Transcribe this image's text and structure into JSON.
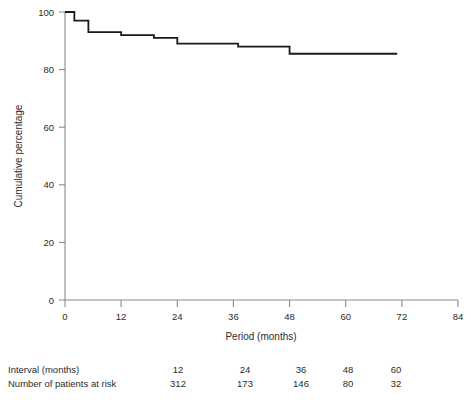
{
  "chart_data": {
    "type": "line",
    "subtype": "kaplan-meier-step",
    "title": "",
    "xlabel": "Period (months)",
    "ylabel": "Cumulative percentage",
    "xlim": [
      0,
      84
    ],
    "ylim": [
      0,
      100
    ],
    "xticks": [
      0,
      12,
      24,
      36,
      48,
      60,
      72,
      84
    ],
    "xticklabels": [
      "0",
      "12",
      "24",
      "36",
      "48",
      "60",
      "72",
      "84"
    ],
    "yticks": [
      0,
      20,
      40,
      60,
      80,
      100
    ],
    "yticklabels": [
      "0",
      "20",
      "40",
      "60",
      "80",
      "100"
    ],
    "grid": false,
    "legend": null,
    "series": [
      {
        "name": "Cumulative percentage",
        "color": "#1a1a1a",
        "step": "post",
        "x": [
          0,
          1,
          2,
          4,
          5,
          11,
          12,
          18,
          19,
          23,
          24,
          36,
          37,
          47,
          48,
          71
        ],
        "y": [
          100,
          100,
          97,
          97,
          93,
          93,
          92,
          92,
          91,
          91,
          89,
          89,
          88,
          88,
          85.5,
          85.5
        ]
      }
    ]
  },
  "risk_table": {
    "rows": [
      {
        "label": "Interval (months)",
        "values": [
          "12",
          "24",
          "36",
          "48",
          "60"
        ]
      },
      {
        "label": "Number of patients at risk",
        "values": [
          "312",
          "173",
          "146",
          "80",
          "32"
        ]
      }
    ],
    "value_positions": [
      155,
      222,
      278,
      325,
      373
    ]
  },
  "colors": {
    "line": "#1a1a1a",
    "axis": "#808080",
    "text": "#2b2b2b",
    "background": "#ffffff"
  }
}
